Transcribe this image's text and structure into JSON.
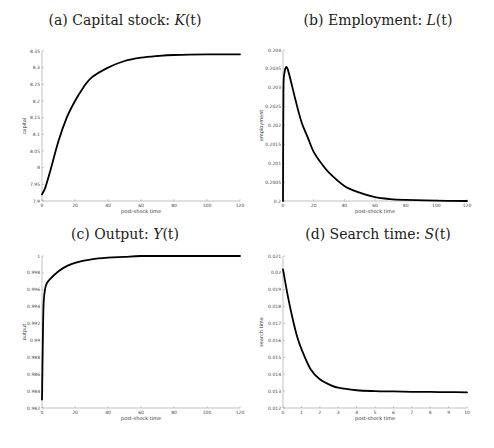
{
  "figure": {
    "panels": [
      {
        "id": "a",
        "title_prefix": "(a) Capital stock: ",
        "title_var": "K",
        "title_arg": "(t)"
      },
      {
        "id": "b",
        "title_prefix": "(b) Employment: ",
        "title_var": "L",
        "title_arg": "(t)"
      },
      {
        "id": "c",
        "title_prefix": "(c) Output: ",
        "title_var": "Y",
        "title_arg": "(t)"
      },
      {
        "id": "d",
        "title_prefix": "(d) Search time: ",
        "title_var": "S",
        "title_arg": "(t)"
      }
    ]
  },
  "chart_data": [
    {
      "type": "line",
      "title": "(a) Capital stock: K(t)",
      "xlabel": "post-shock time",
      "ylabel": "capital",
      "xlim": [
        0,
        120
      ],
      "ylim": [
        7.9,
        8.35
      ],
      "xticks": [
        "0",
        "20",
        "40",
        "60",
        "80",
        "100",
        "120"
      ],
      "yticks": [
        "7.9",
        "7.95",
        "8",
        "8.05",
        "8.1",
        "8.15",
        "8.2",
        "8.25",
        "8.3",
        "8.35"
      ],
      "grid": false,
      "series": [
        {
          "name": "K(t)",
          "color": "#000000",
          "x": [
            0,
            2,
            5,
            10,
            15,
            20,
            25,
            30,
            40,
            50,
            60,
            70,
            80,
            100,
            120
          ],
          "y": [
            7.92,
            7.94,
            7.99,
            8.08,
            8.15,
            8.2,
            8.24,
            8.27,
            8.3,
            8.32,
            8.33,
            8.335,
            8.338,
            8.34,
            8.34
          ]
        }
      ]
    },
    {
      "type": "line",
      "title": "(b) Employment: L(t)",
      "xlabel": "post-shock time",
      "ylabel": "employment",
      "xlim": [
        0,
        120
      ],
      "ylim": [
        0.2,
        0.204
      ],
      "xticks": [
        "0",
        "20",
        "40",
        "60",
        "80",
        "100",
        "120"
      ],
      "yticks": [
        "0.2",
        "0.2005",
        "0.201",
        "0.2015",
        "0.202",
        "0.2025",
        "0.203",
        "0.2035",
        "0.204"
      ],
      "grid": false,
      "series": [
        {
          "name": "L(t)",
          "color": "#000000",
          "x": [
            0,
            0.3,
            1,
            2,
            3,
            5,
            8,
            12,
            16,
            20,
            25,
            30,
            40,
            50,
            60,
            70,
            80,
            100,
            120
          ],
          "y": [
            0.2,
            0.203,
            0.2034,
            0.20355,
            0.2035,
            0.2032,
            0.2027,
            0.2021,
            0.2017,
            0.2013,
            0.201,
            0.20075,
            0.2004,
            0.20022,
            0.2001,
            0.20005,
            0.20003,
            0.20001,
            0.2
          ]
        }
      ]
    },
    {
      "type": "line",
      "title": "(c) Output: Y(t)",
      "xlabel": "post-shock time",
      "ylabel": "output",
      "xlim": [
        0,
        120
      ],
      "ylim": [
        0.982,
        1.0
      ],
      "xticks": [
        "0",
        "20",
        "40",
        "60",
        "80",
        "100",
        "120"
      ],
      "yticks": [
        "0.982",
        "0.984",
        "0.986",
        "0.988",
        "0.99",
        "0.992",
        "0.994",
        "0.996",
        "0.998",
        "1"
      ],
      "grid": false,
      "series": [
        {
          "name": "Y(t)",
          "color": "#000000",
          "x": [
            0,
            0.5,
            1,
            2,
            3,
            5,
            10,
            15,
            20,
            30,
            40,
            50,
            60,
            80,
            100,
            120
          ],
          "y": [
            0.983,
            0.99,
            0.9945,
            0.9962,
            0.9968,
            0.9973,
            0.9982,
            0.9988,
            0.9992,
            0.9996,
            0.9998,
            0.9999,
            1.0,
            1.0,
            1.0,
            1.0
          ]
        }
      ]
    },
    {
      "type": "line",
      "title": "(d) Search time: S(t)",
      "xlabel": "post-shock time",
      "ylabel": "search time",
      "xlim": [
        0,
        10
      ],
      "ylim": [
        0.012,
        0.021
      ],
      "xticks": [
        "0",
        "1",
        "2",
        "3",
        "4",
        "5",
        "6",
        "7",
        "8",
        "9",
        "10"
      ],
      "yticks": [
        "0.012",
        "0.013",
        "0.014",
        "0.015",
        "0.016",
        "0.017",
        "0.018",
        "0.019",
        "0.02",
        "0.021"
      ],
      "grid": false,
      "series": [
        {
          "name": "S(t)",
          "color": "#000000",
          "x": [
            0,
            0.25,
            0.5,
            0.75,
            1,
            1.5,
            2,
            2.5,
            3,
            4,
            5,
            6,
            7,
            8,
            9,
            10
          ],
          "y": [
            0.0202,
            0.0187,
            0.0174,
            0.0163,
            0.0155,
            0.0143,
            0.0137,
            0.0134,
            0.0132,
            0.01305,
            0.013,
            0.01298,
            0.01296,
            0.01295,
            0.01294,
            0.01293
          ]
        }
      ]
    }
  ]
}
